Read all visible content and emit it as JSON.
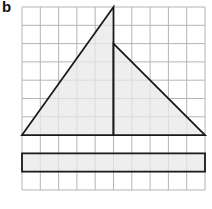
{
  "figure": {
    "label": "b",
    "grid": {
      "columns": 10,
      "rows": 10,
      "origin_x": 22,
      "origin_y": 7,
      "cell": 18.3
    },
    "colors": {
      "grid": "#b5b5b5",
      "fill": "#e8e8e8",
      "stroke": "#1a1a1a"
    },
    "shapes": [
      {
        "name": "left-triangle",
        "points": "0,7 5,7 5,0"
      },
      {
        "name": "right-triangle",
        "points": "5,2 5,7 10,7"
      },
      {
        "name": "rectangle",
        "points": "0,8 10,8 10,9 0,9"
      }
    ]
  }
}
